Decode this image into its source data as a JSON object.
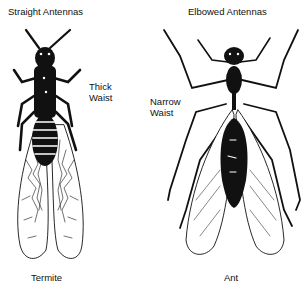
{
  "diagram": {
    "termite": {
      "antenna_label": "Straight Antennas",
      "waist_label_line1": "Thick",
      "waist_label_line2": "Waist",
      "name": "Termite"
    },
    "ant": {
      "antenna_label": "Elbowed Antennas",
      "waist_label_line1": "Narrow",
      "waist_label_line2": "Waist",
      "name": "Ant"
    },
    "colors": {
      "ink": "#111111",
      "paper": "#ffffff"
    }
  }
}
